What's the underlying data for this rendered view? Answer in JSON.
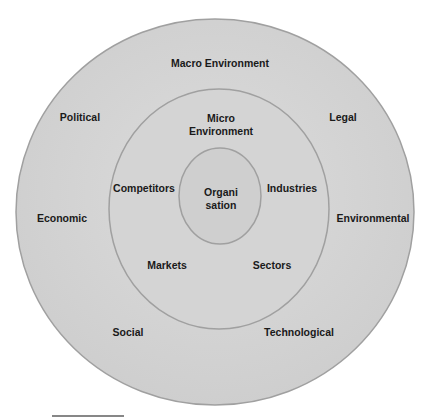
{
  "diagram": {
    "type": "concentric-circles",
    "colors": {
      "fill": "#d2d2d2",
      "stroke": "#9a9a9a",
      "text": "#1a1a1a"
    },
    "outer_ring": {
      "title": "Macro Environment",
      "factors": [
        "Political",
        "Legal",
        "Economic",
        "Environmental",
        "Social",
        "Technological"
      ]
    },
    "middle_ring": {
      "title_line1": "Micro",
      "title_line2": "Environment",
      "factors": [
        "Competitors",
        "Industries",
        "Markets",
        "Sectors"
      ]
    },
    "core": {
      "line1": "Organi",
      "line2": "sation"
    }
  }
}
